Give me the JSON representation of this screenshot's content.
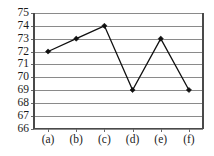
{
  "chart_data": {
    "type": "line",
    "title": "",
    "subtitle": "",
    "xlabel": "",
    "ylabel": "",
    "categories": [
      "(a)",
      "(b)",
      "(c)",
      "(d)",
      "(e)",
      "(f)"
    ],
    "values": [
      72,
      73,
      74,
      69,
      73,
      69
    ],
    "series": [
      {
        "name": "",
        "values": [
          72,
          73,
          74,
          69,
          73,
          69
        ]
      }
    ],
    "ylim": [
      66,
      75
    ],
    "ytick_labels": [
      "75",
      "74",
      "73",
      "72",
      "71",
      "70",
      "69",
      "68",
      "67",
      "66"
    ],
    "ytick_values": [
      75,
      74,
      73,
      72,
      71,
      70,
      69,
      68,
      67,
      66
    ],
    "ytick_step": 1,
    "xtick_labels": [
      "(a)",
      "(b)",
      "(c)",
      "(d)",
      "(e)",
      "(f)"
    ],
    "grid": true,
    "grid_orientation": "horizontal",
    "legend": false,
    "legend_position": "none",
    "markers": true,
    "marker_shape": "diamond",
    "annotations": [],
    "colors": {
      "line": "#101010",
      "marker": "#101010",
      "grid": "#8a8a8a",
      "axis": "#4a4a4a",
      "text": "#1a1a1a",
      "background": "#ffffff"
    }
  }
}
